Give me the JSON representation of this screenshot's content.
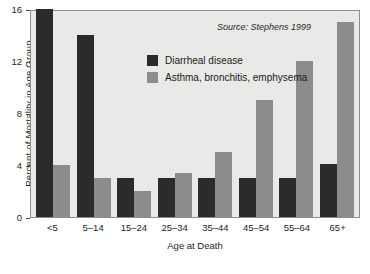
{
  "chart_data": {
    "type": "bar",
    "title": "",
    "xlabel": "Age at Death",
    "ylabel": "Percent of Mortality in Age Group",
    "categories": [
      "<5",
      "5–14",
      "15–24",
      "25–34",
      "35–44",
      "45–54",
      "55–64",
      "65+"
    ],
    "series": [
      {
        "name": "Diarrheal disease",
        "color": "#2b2b2b",
        "values": [
          16,
          14,
          3,
          3,
          3,
          3,
          3,
          4.1
        ]
      },
      {
        "name": "Asthma, bronchitis, emphysema",
        "color": "#8c8c8c",
        "values": [
          4,
          3,
          2,
          3.4,
          5,
          9,
          12,
          15
        ]
      }
    ],
    "ylim": [
      0,
      16
    ],
    "yticks": [
      0,
      4,
      8,
      12,
      16
    ],
    "ytick_labels": [
      "0",
      "4",
      "8",
      "12",
      "16"
    ],
    "grid": false,
    "legend_position": "upper-center",
    "annotations": [
      {
        "name": "source",
        "text": "Source: Stephens 1999"
      }
    ],
    "plot_background": "#e9e9e7",
    "axis_color": "#8d8d8d"
  },
  "legend": {
    "items": [
      {
        "label": "Diarrheal disease"
      },
      {
        "label": "Asthma, bronchitis, emphysema"
      }
    ]
  },
  "source": {
    "text": "Source: Stephens 1999"
  }
}
